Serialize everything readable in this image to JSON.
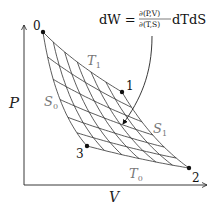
{
  "diagram": {
    "axes": {
      "x_label": "V",
      "y_label": "P"
    },
    "formula": {
      "lhs": "dW = ",
      "num": "∂(P,V)",
      "den": "∂(T,S)",
      "rhs": "dTdS"
    },
    "points": [
      {
        "label": "0",
        "x": 43,
        "y": 32,
        "lx": 33,
        "ly": 30
      },
      {
        "label": "1",
        "x": 122,
        "y": 92,
        "lx": 126,
        "ly": 90
      },
      {
        "label": "2",
        "x": 189,
        "y": 168,
        "lx": 192,
        "ly": 182
      },
      {
        "label": "3",
        "x": 87,
        "y": 146,
        "lx": 76,
        "ly": 158
      }
    ],
    "curve_labels": [
      {
        "text": "T",
        "sub": "1",
        "x": 87,
        "y": 65
      },
      {
        "text": "S",
        "sub": "0",
        "x": 44,
        "y": 106
      },
      {
        "text": "S",
        "sub": "1",
        "x": 153,
        "y": 133
      },
      {
        "text": "T",
        "sub": "0",
        "x": 129,
        "y": 178
      }
    ],
    "grid": {
      "isotherms": 6,
      "adiabats": 6
    },
    "colors": {
      "line": "#333333",
      "axis": "#222222",
      "grey_label": "#777777"
    }
  }
}
